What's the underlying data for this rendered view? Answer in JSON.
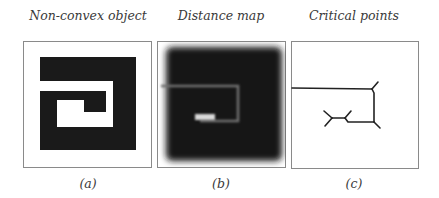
{
  "figure": {
    "panels": [
      {
        "id": "a",
        "title": "Non-convex object",
        "caption": "(a)"
      },
      {
        "id": "b",
        "title": "Distance map",
        "caption": "(b)"
      },
      {
        "id": "c",
        "title": "Critical points",
        "caption": "(c)"
      }
    ]
  },
  "colors": {
    "object": "#1a1a1a",
    "background": "#ffffff",
    "frame": "#8a8a8a",
    "skeleton_line": "#222222",
    "distance_ridge": "#6a6a6a",
    "distance_peak": "#d8d8d8"
  }
}
